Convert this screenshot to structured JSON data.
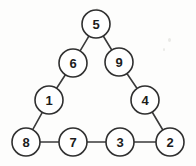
{
  "diagram": {
    "type": "magic-triangle-puzzle",
    "canvas": {
      "width": 196,
      "height": 166,
      "background": "#fdfdfc"
    },
    "style": {
      "node_radius": 14,
      "node_fill": "#ffffff",
      "node_stroke": "#2f2f2f",
      "edge_stroke": "#3a3a3a",
      "stroke_width": 1.6,
      "label_color": "#1c1c1c"
    },
    "nodes": [
      {
        "id": "n5",
        "label": "5",
        "x": 96,
        "y": 24,
        "position": "apex"
      },
      {
        "id": "n6",
        "label": "6",
        "x": 73,
        "y": 63,
        "position": "left-upper"
      },
      {
        "id": "n9",
        "label": "9",
        "x": 119,
        "y": 62,
        "position": "right-upper"
      },
      {
        "id": "n1",
        "label": "1",
        "x": 49,
        "y": 100,
        "position": "left-lower"
      },
      {
        "id": "n4",
        "label": "4",
        "x": 145,
        "y": 100,
        "position": "right-lower"
      },
      {
        "id": "n8",
        "label": "8",
        "x": 26,
        "y": 142,
        "position": "bottom-left-corner"
      },
      {
        "id": "n7",
        "label": "7",
        "x": 73,
        "y": 142,
        "position": "bottom-inner-left"
      },
      {
        "id": "n3",
        "label": "3",
        "x": 120,
        "y": 142,
        "position": "bottom-inner-right"
      },
      {
        "id": "n2",
        "label": "2",
        "x": 170,
        "y": 142,
        "position": "bottom-right-corner"
      }
    ],
    "edges": [
      {
        "id": "e-5-6",
        "from": "n5",
        "to": "n6"
      },
      {
        "id": "e-6-1",
        "from": "n6",
        "to": "n1"
      },
      {
        "id": "e-1-8",
        "from": "n1",
        "to": "n8"
      },
      {
        "id": "e-5-9",
        "from": "n5",
        "to": "n9"
      },
      {
        "id": "e-9-4",
        "from": "n9",
        "to": "n4"
      },
      {
        "id": "e-4-2",
        "from": "n4",
        "to": "n2"
      },
      {
        "id": "e-8-7",
        "from": "n8",
        "to": "n7"
      },
      {
        "id": "e-7-3",
        "from": "n7",
        "to": "n3"
      },
      {
        "id": "e-3-2",
        "from": "n3",
        "to": "n2"
      }
    ],
    "sides": {
      "left": [
        "5",
        "6",
        "1",
        "8"
      ],
      "right": [
        "5",
        "9",
        "4",
        "2"
      ],
      "bottom": [
        "8",
        "7",
        "3",
        "2"
      ]
    }
  }
}
